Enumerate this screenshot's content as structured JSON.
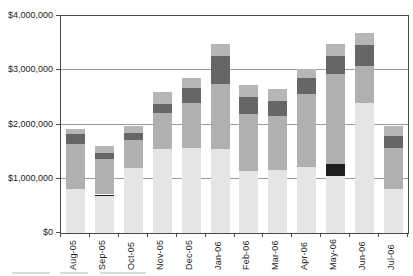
{
  "chart_data": {
    "type": "bar",
    "stacked": true,
    "title": "",
    "xlabel": "",
    "ylabel": "",
    "ylim": [
      0,
      4000000
    ],
    "grid": true,
    "legend": false,
    "categories": [
      "Aug-05",
      "Sep-05",
      "Oct-05",
      "Nov-05",
      "Dec-05",
      "Jan-06",
      "Feb-06",
      "Mar-06",
      "Apr-06",
      "May-06",
      "Jun-06",
      "Jul-06"
    ],
    "ytick_values": [
      0,
      1000000,
      2000000,
      3000000,
      4000000
    ],
    "ytick_labels": [
      "$0",
      "$1,000,000",
      "$2,000,000",
      "$3,000,000",
      "$4,000,000"
    ],
    "series": [
      {
        "name": "segment-bottom-light-gray",
        "color": "#e5e5e5",
        "values": [
          820000,
          680000,
          1200000,
          1540000,
          1570000,
          1540000,
          1140000,
          1170000,
          1220000,
          1050000,
          2400000,
          810000
        ]
      },
      {
        "name": "segment-black-band",
        "color": "#1e1e1e",
        "values": [
          0,
          30000,
          0,
          0,
          0,
          0,
          0,
          0,
          0,
          220000,
          0,
          0
        ]
      },
      {
        "name": "segment-medium-gray",
        "color": "#b0b0b0",
        "values": [
          820000,
          650000,
          520000,
          680000,
          830000,
          1200000,
          1050000,
          980000,
          1350000,
          1660000,
          680000,
          760000
        ]
      },
      {
        "name": "segment-dark-gray-band",
        "color": "#666666",
        "values": [
          180000,
          120000,
          130000,
          150000,
          280000,
          520000,
          310000,
          280000,
          280000,
          340000,
          380000,
          220000
        ]
      },
      {
        "name": "segment-top-cap-gray",
        "color": "#b6b6b6",
        "values": [
          90000,
          120000,
          130000,
          230000,
          180000,
          220000,
          220000,
          220000,
          180000,
          220000,
          220000,
          180000
        ]
      }
    ],
    "totals": [
      1910000,
      1600000,
      1980000,
      2600000,
      2860000,
      3480000,
      2720000,
      2650000,
      3030000,
      3490000,
      3680000,
      1970000
    ]
  },
  "misc": {
    "background_color": "#ffffff",
    "axis_color": "#4a4a4a",
    "gridline_color": "#9b9b9b",
    "cutoff_caption_note": "illegible cropped text fragment at bottom-left edge"
  }
}
